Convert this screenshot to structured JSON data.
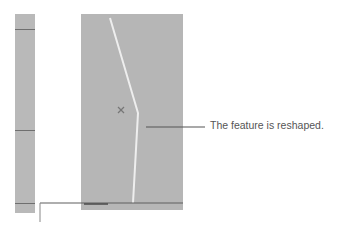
{
  "figure": {
    "callout_text": "The feature is reshaped.",
    "colors": {
      "panel": "#b6b6b6",
      "strip": "#b9b9b9",
      "feature_line": "#eeeeee",
      "edge_line": "#6f6f6f",
      "text": "#555555"
    },
    "markers": [
      {
        "type": "x-marker",
        "x": 121,
        "y": 110
      }
    ]
  }
}
